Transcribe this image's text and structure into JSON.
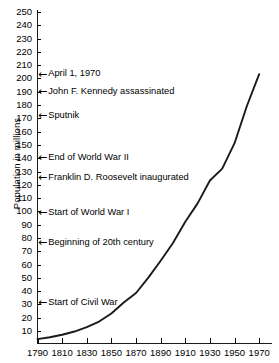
{
  "chart_data": {
    "type": "line",
    "title": "",
    "xlabel": "",
    "ylabel": "Population in millions",
    "xlim": [
      1790,
      1980
    ],
    "ylim": [
      0,
      255
    ],
    "grid": false,
    "legend": "none",
    "x_ticks": [
      "1790",
      "1810",
      "1830",
      "1850",
      "1870",
      "1890",
      "1910",
      "1930",
      "1950",
      "1970"
    ],
    "y_ticks": [
      "10",
      "20",
      "30",
      "40",
      "50",
      "60",
      "70",
      "80",
      "90",
      "100",
      "110",
      "120",
      "130",
      "140",
      "150",
      "160",
      "170",
      "180",
      "190",
      "200",
      "210",
      "220",
      "230",
      "240",
      "250"
    ],
    "series": [
      {
        "name": "U.S. Population",
        "color": "#1a1a1a",
        "x": [
          1790,
          1800,
          1810,
          1820,
          1830,
          1840,
          1850,
          1860,
          1870,
          1880,
          1890,
          1900,
          1910,
          1920,
          1930,
          1940,
          1950,
          1960,
          1970
        ],
        "values": [
          3.9,
          5.3,
          7.2,
          9.6,
          12.9,
          17.1,
          23.2,
          31.4,
          38.6,
          50.2,
          62.9,
          76.2,
          92.2,
          106.0,
          123.2,
          132.2,
          151.3,
          179.3,
          203.2
        ]
      }
    ],
    "annotations": [
      {
        "label": "April 1, 1970",
        "value": 203,
        "arrow": "←"
      },
      {
        "label": "John F. Kennedy assassinated",
        "value": 190,
        "arrow": "←"
      },
      {
        "label": "Sputnik",
        "value": 172,
        "arrow": "←"
      },
      {
        "label": "End of World War II",
        "value": 140,
        "arrow": "←"
      },
      {
        "label": "Franklin D. Roosevelt inaugurated",
        "value": 125,
        "arrow": "←"
      },
      {
        "label": "Start of World War I",
        "value": 99,
        "arrow": "←"
      },
      {
        "label": "Beginning of 20th century",
        "value": 76,
        "arrow": "←"
      },
      {
        "label": "Start of Civil War",
        "value": 31,
        "arrow": "←"
      }
    ]
  }
}
